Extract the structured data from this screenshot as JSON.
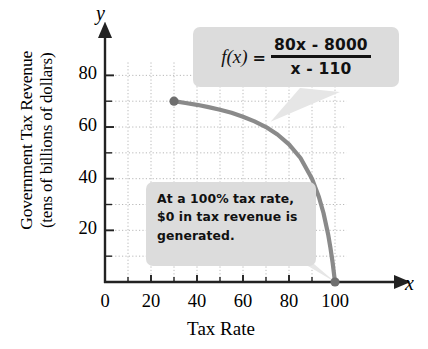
{
  "chart_data": {
    "type": "line",
    "title": "",
    "xlabel": "Tax Rate",
    "ylabel_line1": "Government Tax Revenue",
    "ylabel_line2": "(tens of billions of dollars)",
    "x_axis_variable": "x",
    "y_axis_variable": "y",
    "xlim": [
      0,
      108
    ],
    "ylim": [
      0,
      88
    ],
    "xticks": [
      0,
      20,
      40,
      60,
      80,
      100
    ],
    "xtick_labels": [
      "0",
      "20",
      "40",
      "60",
      "80",
      "100"
    ],
    "yticks": [
      20,
      40,
      60,
      80
    ],
    "ytick_labels": [
      "20",
      "40",
      "60",
      "80"
    ],
    "x_minor_ticks": [
      10,
      30,
      50,
      70,
      90
    ],
    "y_minor_ticks": [
      10,
      30,
      50,
      70
    ],
    "grid": true,
    "grid_style": "dotted",
    "grid_spacing": 10,
    "legend": "none",
    "curve_color": "#8a8a8a",
    "grid_color": "#b8b8b8",
    "axis_color": "#222222",
    "callout_bg": "#dcdcdc",
    "series": [
      {
        "name": "f(x) = (80x - 8000)/(x - 110)",
        "domain": [
          30,
          100
        ],
        "points": [
          {
            "x": 30,
            "y": 70.0
          },
          {
            "x": 35,
            "y": 69.3
          },
          {
            "x": 40,
            "y": 68.6
          },
          {
            "x": 45,
            "y": 67.7
          },
          {
            "x": 50,
            "y": 66.7
          },
          {
            "x": 55,
            "y": 65.5
          },
          {
            "x": 60,
            "y": 64.0
          },
          {
            "x": 65,
            "y": 62.2
          },
          {
            "x": 70,
            "y": 60.0
          },
          {
            "x": 75,
            "y": 57.1
          },
          {
            "x": 80,
            "y": 53.3
          },
          {
            "x": 85,
            "y": 48.0
          },
          {
            "x": 90,
            "y": 40.0
          },
          {
            "x": 93,
            "y": 32.9
          },
          {
            "x": 95,
            "y": 26.7
          },
          {
            "x": 97,
            "y": 18.5
          },
          {
            "x": 98,
            "y": 13.3
          },
          {
            "x": 99,
            "y": 7.3
          },
          {
            "x": 100,
            "y": 0.0
          }
        ],
        "endpoints": [
          {
            "x": 30,
            "y": 70.0,
            "marker": "filled-dot"
          },
          {
            "x": 100,
            "y": 0.0,
            "marker": "filled-dot"
          }
        ]
      }
    ],
    "annotations": [
      {
        "name": "formula-callout",
        "text": "f(x) = (80x - 8000) / (x - 110)",
        "function_label": "f(x)",
        "equals": "=",
        "numerator": "80x - 8000",
        "denominator": "x - 110",
        "points_to": {
          "x": 72,
          "y": 62
        }
      },
      {
        "name": "note-callout",
        "line1": "At a 100% tax rate,",
        "line2": "$0 in tax revenue is",
        "line3": "generated.",
        "points_to": {
          "x": 100,
          "y": 0
        }
      }
    ]
  }
}
